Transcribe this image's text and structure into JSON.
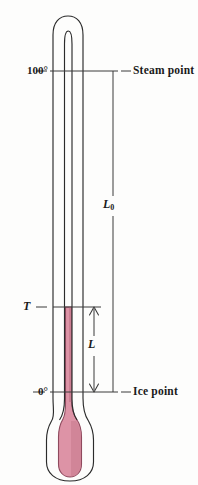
{
  "figure": {
    "name": "thermometer-diagram",
    "background_color": "#fdfdfc"
  },
  "labels": {
    "steam_temperature": "100°",
    "ice_temperature": "0°",
    "steam_point": "Steam point",
    "ice_point": "Ice point",
    "length_total_symbol": "L",
    "length_total_subscript": "0",
    "temperature_symbol": "T",
    "length_symbol": "L"
  },
  "colors": {
    "mercury_fill": "#dd93a6",
    "mercury_fill_dark": "#c4768c",
    "mercury_outline": "#8f4a5e",
    "glass_outline": "#2b2b2b",
    "text": "#1a1a1a",
    "leader_line": "#555555"
  },
  "geometry": {
    "steam_point_y": 71,
    "ice_point_y": 392,
    "temperature_mark_y": 307,
    "tube_outer_left": 53,
    "tube_outer_right": 83,
    "tube_inner_left": 64,
    "tube_inner_right": 72,
    "bulb_bottom_y": 477,
    "L0_axis_x": 113,
    "L_axis_x": 94
  },
  "annotations": {
    "L0_meaning": "Length of liquid column between ice point and steam point",
    "L_meaning": "Length of liquid column above the ice point at temperature T"
  }
}
